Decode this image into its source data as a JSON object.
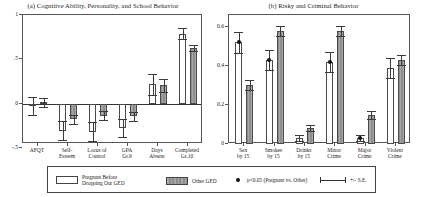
{
  "figure": {
    "panel_a_title": "(a) Cognitive Ability, Personality, and School Behavior",
    "panel_b_title": "(b) Risky and Criminal Behavior"
  },
  "legend": {
    "series_white": "Pregnant Before\nDropping Out GED",
    "series_gray": "Other GED",
    "significance": "p<0.05 (Pregnant vs. Other)",
    "errorbar": "+/- S.E."
  },
  "chart_data": [
    {
      "type": "bar",
      "title": "(a) Cognitive Ability, Personality, and School Behavior",
      "xlabel": "",
      "ylabel": "",
      "ylim": [
        -0.45,
        1.0
      ],
      "yticks": [
        1,
        0.5,
        0,
        -0.5
      ],
      "ytick_labels": [
        "1",
        ".5",
        "0",
        "-.5"
      ],
      "grid": false,
      "legend_position": "bottom",
      "categories": [
        "AFQT",
        "Self-\nEsteem",
        "Locus of\nControl",
        "GPA\nGr.9",
        "Days\nAbsent",
        "Completed\nGr.10"
      ],
      "series": [
        {
          "name": "Pregnant Before Dropping Out GED",
          "values": [
            -0.02,
            -0.3,
            -0.31,
            -0.27,
            0.22,
            0.79
          ],
          "errors": [
            0.1,
            0.11,
            0.11,
            0.1,
            0.12,
            0.06
          ]
        },
        {
          "name": "Other GED",
          "values": [
            0.02,
            -0.17,
            -0.13,
            -0.14,
            0.21,
            0.63
          ],
          "errors": [
            0.05,
            0.05,
            0.05,
            0.05,
            0.07,
            0.03
          ]
        }
      ],
      "significance_markers": []
    },
    {
      "type": "bar",
      "title": "(b) Risky and Criminal Behavior",
      "xlabel": "",
      "ylabel": "",
      "ylim": [
        0,
        0.66
      ],
      "yticks": [
        0.6,
        0.4,
        0.2,
        0
      ],
      "ytick_labels": [
        "0.6",
        "0.4",
        "0.2",
        "0"
      ],
      "grid": false,
      "legend_position": "bottom",
      "categories": [
        "Sex\nby 15",
        "Smokes\nby 15",
        "Drinks\nby 15",
        "Minor\nCrime",
        "Major\nCrime",
        "Violent\nCrime"
      ],
      "series": [
        {
          "name": "Pregnant Before Dropping Out GED",
          "values": [
            0.52,
            0.43,
            0.03,
            0.42,
            0.03,
            0.39
          ],
          "errors": [
            0.055,
            0.05,
            0.017,
            0.05,
            0.015,
            0.05
          ]
        },
        {
          "name": "Other GED",
          "values": [
            0.3,
            0.58,
            0.08,
            0.58,
            0.15,
            0.43
          ],
          "errors": [
            0.025,
            0.025,
            0.015,
            0.025,
            0.02,
            0.025
          ]
        }
      ],
      "significance_markers": [
        {
          "category": "Sex\nby 15",
          "value": 0.52
        },
        {
          "category": "Smokes\nby 15",
          "value": 0.43
        },
        {
          "category": "Minor\nCrime",
          "value": 0.42
        },
        {
          "category": "Major\nCrime",
          "value": 0.03
        }
      ]
    }
  ]
}
